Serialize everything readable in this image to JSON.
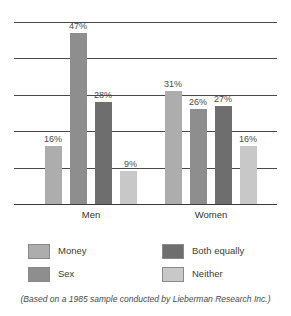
{
  "chart_data": {
    "type": "bar",
    "title": "",
    "subtitle": "",
    "xlabel": "",
    "ylabel": "",
    "ylim": [
      0,
      52.5
    ],
    "grid": true,
    "gridline_values": [
      0,
      10,
      20,
      30,
      40,
      50
    ],
    "legend_position": "bottom",
    "categories": [
      "Men",
      "Women"
    ],
    "series": [
      {
        "name": "Money",
        "color": "#ADADAD",
        "values": [
          16,
          31
        ],
        "labels": [
          "16%",
          "31%"
        ]
      },
      {
        "name": "Sex",
        "color": "#8E8E8E",
        "values": [
          47,
          26
        ],
        "labels": [
          "47%",
          "26%"
        ]
      },
      {
        "name": "Both equally",
        "color": "#6E6E6E",
        "values": [
          28,
          27
        ],
        "labels": [
          "28%",
          "27%"
        ]
      },
      {
        "name": "Neither",
        "color": "#C8C8C8",
        "values": [
          9,
          16
        ],
        "labels": [
          "9%",
          "16%"
        ]
      }
    ],
    "annotations": [
      "(Based on a 1985 sample conducted by Lieberman Research Inc.)"
    ]
  },
  "axis": {
    "group_labels": [
      "Men",
      "Women"
    ]
  },
  "legend": {
    "items": [
      {
        "label": "Money",
        "color": "#ADADAD"
      },
      {
        "label": "Sex",
        "color": "#8E8E8E"
      },
      {
        "label": "Both equally",
        "color": "#6E6E6E"
      },
      {
        "label": "Neither",
        "color": "#C8C8C8"
      }
    ]
  },
  "caption": {
    "text": "(Based on a 1985 sample conducted by Lieberman Research Inc.)"
  },
  "bar_labels": {
    "men_money": "16%",
    "men_sex": "47%",
    "men_both": "28%",
    "men_neither": "9%",
    "women_money": "31%",
    "women_sex": "26%",
    "women_both": "27%",
    "women_neither": "16%"
  }
}
